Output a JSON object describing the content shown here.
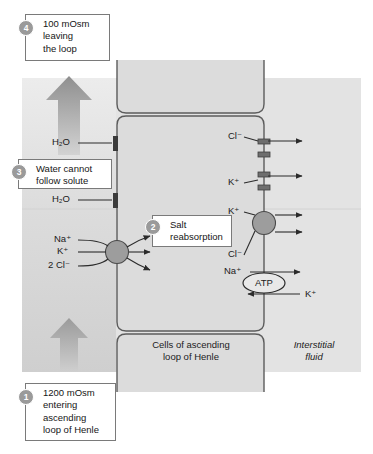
{
  "figure": {
    "title_alt": "Salt reabsorption in the ascending loop of Henle",
    "panel_bg": "#e2e2e2",
    "cell_fill": "#dcdcdc",
    "outline": "#5c5c5c",
    "transporter_fill": "#9d9d9d",
    "arrow_color": "#2b2b2b",
    "dot_color": "#9a9a9a"
  },
  "callouts": [
    {
      "num": "4",
      "text": "100 mOsm\nleaving\nthe loop"
    },
    {
      "num": "3",
      "text": "Water cannot\nfollow solute"
    },
    {
      "num": "2",
      "text": "Salt\nreabsorption"
    },
    {
      "num": "1",
      "text": "1200 mOsm\nentering\nascending\nloop of Henle"
    }
  ],
  "region_labels": {
    "cells": "Cells of ascending\nloop of Henle",
    "interstitial": "Interstitial\nfluid"
  },
  "water_labels": [
    {
      "name": "h2o-upper",
      "text": "H₂O"
    },
    {
      "name": "h2o-lower",
      "text": "H₂O"
    }
  ],
  "apical_ions": [
    {
      "name": "sodium",
      "text": "Na⁺"
    },
    {
      "name": "potassium",
      "text": "K⁺"
    },
    {
      "name": "chloride",
      "text": "2 Cl⁻"
    }
  ],
  "basolateral_ions": [
    {
      "name": "chloride-channel",
      "text": "Cl⁻"
    },
    {
      "name": "potassium-channel",
      "text": "K⁺"
    },
    {
      "name": "potassium-cotransport",
      "text": "K⁺"
    },
    {
      "name": "chloride-cotransport",
      "text": "Cl⁻"
    }
  ],
  "pump": {
    "label": "ATP",
    "in_ion": "Na⁺",
    "out_ion": "K⁺"
  },
  "flow_arrows": {
    "up_label": "filtrate flow ascending",
    "up_big_label": "filtrate leaving loop"
  }
}
